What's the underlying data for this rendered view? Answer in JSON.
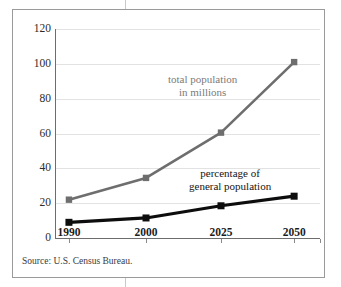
{
  "figure": {
    "source_note": "Source: U.S. Census Bureau.",
    "annotations": {
      "total_line1": "total population",
      "total_line2": "in millions",
      "pct_line1": "percentage of",
      "pct_line2": "general population"
    },
    "colors": {
      "total_series": "#6e6e6e",
      "percentage_series": "#0d0d0d",
      "gridline": "#e2e2e2",
      "axis": "#6d6d6d",
      "frame": "#9a9a9a"
    }
  },
  "chart_data": {
    "type": "line",
    "title": "",
    "xlabel": "",
    "ylabel": "",
    "categories": [
      "1990",
      "2000",
      "2025",
      "2050"
    ],
    "x": [
      1990,
      2000,
      2025,
      2050
    ],
    "ylim": [
      0,
      120
    ],
    "yticks": [
      0,
      20,
      40,
      60,
      80,
      100,
      120
    ],
    "ytick_labels": [
      "0",
      "20",
      "40",
      "60",
      "80",
      "100",
      "120"
    ],
    "grid": true,
    "legend": "annotations-inline",
    "series": [
      {
        "name": "total population in millions",
        "color": "#6e6e6e",
        "marker": "square",
        "values": [
          22,
          34.5,
          60.5,
          101
        ]
      },
      {
        "name": "percentage of general population",
        "color": "#0d0d0d",
        "marker": "square",
        "values": [
          9,
          11.5,
          18.5,
          24
        ]
      }
    ]
  }
}
